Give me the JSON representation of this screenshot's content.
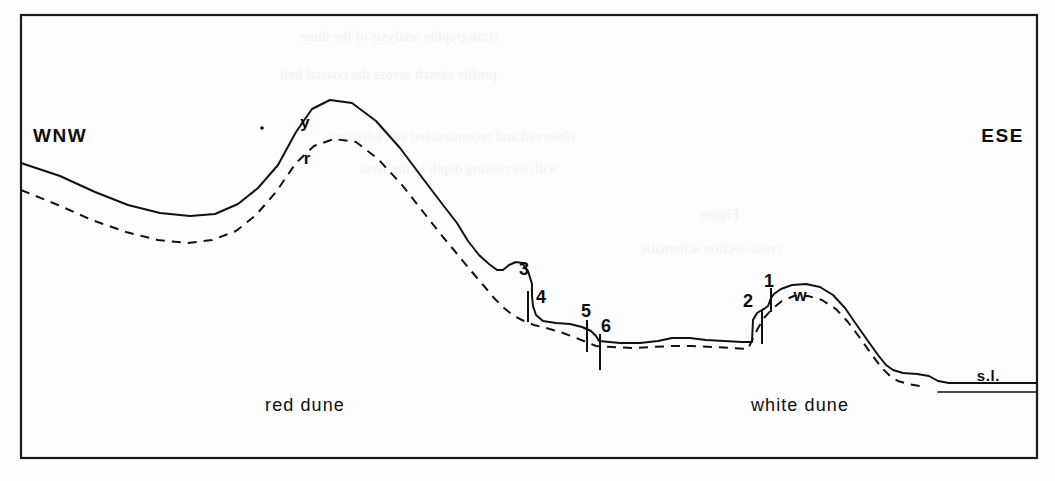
{
  "figure": {
    "type": "geological-cross-section",
    "frame": {
      "x": 21,
      "y": 15,
      "width": 1016,
      "height": 443,
      "stroke": "#1a1a1a"
    },
    "direction_labels": {
      "left": "WNW",
      "right": "ESE"
    },
    "terrain_labels": {
      "red_dune": "red dune",
      "white_dune": "white dune",
      "sea_level": "s.l."
    },
    "horizon_codes": [
      {
        "id": "y-horizon",
        "label": "y",
        "x": 305,
        "y": 128
      },
      {
        "id": "r-horizon",
        "label": "r",
        "x": 307,
        "y": 164
      },
      {
        "id": "w-horizon",
        "label": "w",
        "x": 800,
        "y": 301
      }
    ],
    "sample_numbers": [
      {
        "id": "sample-3",
        "label": "3",
        "x": 524,
        "y": 275
      },
      {
        "id": "sample-4",
        "label": "4",
        "x": 541,
        "y": 303
      },
      {
        "id": "sample-5",
        "label": "5",
        "x": 586,
        "y": 317
      },
      {
        "id": "sample-6",
        "label": "6",
        "x": 606,
        "y": 332
      },
      {
        "id": "sample-2",
        "label": "2",
        "x": 748,
        "y": 307
      },
      {
        "id": "sample-1",
        "label": "1",
        "x": 769,
        "y": 287
      }
    ],
    "colors": {
      "ink": "#111111",
      "frame": "#1a1a1a",
      "paper": "#fdfdfd"
    }
  },
  "chart_data": {
    "type": "line",
    "xlabel": "",
    "ylabel": "",
    "grid": false,
    "legend": "none",
    "note": "Screen pixel coordinates; y increases downward (lower y = higher elevation).",
    "series": [
      {
        "name": "surface-profile-solid",
        "style": "solid",
        "points": "21,163 60,176 95,192 128,205 160,213 190,216 215,214 238,204 258,188 278,165 296,132 312,109 330,100 352,103 376,121 400,148 424,180 443,205 457,223 468,241 479,255 489,264 497,270 503,270 509,265 516,262 522,263 528,271 532,284 532,296 533,306 536,315 543,321 556,323 570,324 582,327 591,331 596,336 599,341 620,343 640,343 658,341 672,338 690,338 706,340 724,341 742,342 752,342 753,320 757,313 762,310 764,309 768,306 771,298 774,294 781,289 792,285 806,284 820,287 833,295 845,308 856,324 868,341 878,355 886,365 893,370 903,373 917,374 929,376 938,381 949,383 1000,383 1037,383"
      },
      {
        "name": "buried-profile-dashed",
        "style": "dashed",
        "points": "21,190 58,205 92,220 126,232 158,240 188,243 212,240 236,231 256,215 276,192 296,163 314,146 334,139 356,142 378,159 402,185 424,213 443,237 458,255 472,272 484,286 494,298 504,308 514,316 524,321 534,325 546,328 560,332 574,337 586,342 596,346 612,347 632,348 652,347 672,346 692,346 712,347 732,348 748,349 757,330 764,318 772,309 782,301 794,296 808,296 822,300 836,309 848,322 860,338 872,355 882,368 890,376 898,381 908,384 920,386"
      },
      {
        "name": "sea-level-line-upper",
        "style": "solid",
        "points": "949,383 1037,383"
      },
      {
        "name": "sea-level-line-lower",
        "style": "solid",
        "points": "938,392 1037,392"
      }
    ],
    "tick_marks": [
      {
        "id": "tick-4",
        "x": 528,
        "y1": 291,
        "y2": 322
      },
      {
        "id": "tick-5",
        "x": 587,
        "y1": 320,
        "y2": 352
      },
      {
        "id": "tick-6",
        "x": 600,
        "y1": 334,
        "y2": 370
      },
      {
        "id": "tick-2",
        "x": 762,
        "y1": 310,
        "y2": 344
      },
      {
        "id": "tick-1",
        "x": 771,
        "y1": 288,
        "y2": 312
      }
    ],
    "point_markers": [
      {
        "id": "dot-y",
        "x": 262,
        "y": 128,
        "r": 1.8
      }
    ]
  },
  "bleed_text": {
    "lines": [
      {
        "text": "stratigraphie analysis of the dune",
        "x": 300,
        "y": 28
      },
      {
        "text": "profile sketch across the coastal belt",
        "x": 280,
        "y": 66
      },
      {
        "text": "observed and reconstructed soil horizons",
        "x": 330,
        "y": 128
      },
      {
        "text": "with increasing depth to the west",
        "x": 360,
        "y": 160
      },
      {
        "text": "Figure",
        "x": 700,
        "y": 206
      },
      {
        "text": "cross-section schematic",
        "x": 640,
        "y": 240
      }
    ]
  }
}
